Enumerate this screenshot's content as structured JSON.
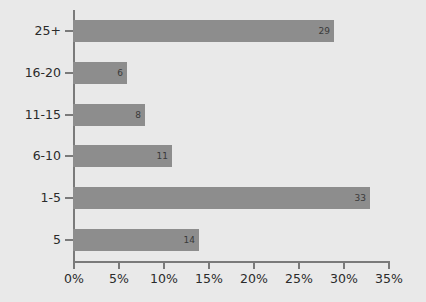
{
  "chart_data": {
    "type": "bar",
    "orientation": "horizontal",
    "title": "",
    "subtitle": "",
    "xlabel": "",
    "ylabel": "",
    "categories": [
      "25+",
      "16-20",
      "11-15",
      "6-10",
      "1-5",
      "5"
    ],
    "values": [
      29,
      6,
      8,
      11,
      33,
      14
    ],
    "value_labels": [
      "29",
      "6",
      "8",
      "11",
      "33",
      "14"
    ],
    "xlim": [
      0,
      35
    ],
    "x_tick_values": [
      0,
      5,
      10,
      15,
      20,
      25,
      30,
      35
    ],
    "x_tick_labels": [
      "0%",
      "5%",
      "10%",
      "15%",
      "20%",
      "25%",
      "30%",
      "35%"
    ],
    "grid": false,
    "legend": null,
    "bar_color": "#8d8d8d",
    "background_color": "#e9e9e9",
    "axis_color": "#7a7a7a",
    "text_color": "#2b2b2b"
  }
}
